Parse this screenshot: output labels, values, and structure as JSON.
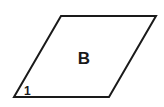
{
  "diagram": {
    "shape": "parallelogram",
    "vertices": [
      {
        "x": 14,
        "y": 97
      },
      {
        "x": 61,
        "y": 16
      },
      {
        "x": 156,
        "y": 16
      },
      {
        "x": 109,
        "y": 97
      }
    ],
    "stroke_color": "#1a1a1a",
    "stroke_width": 2,
    "fill_color": "#ffffff",
    "center_label": "B",
    "angle_label": "1"
  }
}
